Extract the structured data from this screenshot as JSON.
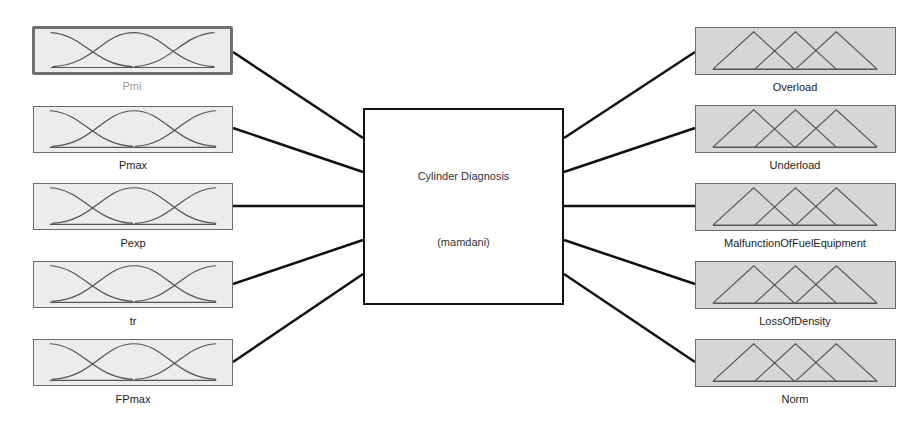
{
  "system": {
    "name": "Cylinder Diagnosis",
    "type": "(mamdani)"
  },
  "inputs": [
    {
      "name": "Pmi",
      "selected": true
    },
    {
      "name": "Pmax",
      "selected": false
    },
    {
      "name": "Pexp",
      "selected": false
    },
    {
      "name": "tr",
      "selected": false
    },
    {
      "name": "FPmax",
      "selected": false
    }
  ],
  "outputs": [
    {
      "name": "Overload"
    },
    {
      "name": "Underload"
    },
    {
      "name": "MalfunctionOfFuelEquipment"
    },
    {
      "name": "LossOfDensity"
    },
    {
      "name": "Norm"
    }
  ],
  "colors": {
    "input_fill": "#ececec",
    "output_fill": "#d6d6d6",
    "wire": "#111111",
    "mf_curve": "#555555"
  }
}
